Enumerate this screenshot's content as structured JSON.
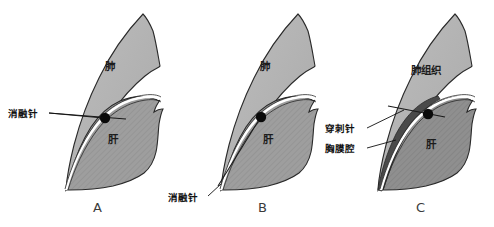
{
  "figure": {
    "type": "medical-illustration",
    "background_color": "#ffffff",
    "colors": {
      "lung_fill": "#b3b3b3",
      "liver_fill": "#9e9e9e",
      "pleural_cavity_fill": "#4a4a4a",
      "outline": "#2a2a2a",
      "diaphragm": "#ffffff",
      "tumor": "#0a0a0a",
      "text": "#111111",
      "panel_letter": "#3b3b3b"
    }
  },
  "panels": [
    {
      "letter": "A",
      "organ_labels": [
        {
          "text": "肺",
          "name": "lung"
        },
        {
          "text": "肝",
          "name": "liver"
        }
      ],
      "callouts": [
        {
          "text": "消融针",
          "name": "ablation-needle"
        }
      ],
      "tumor": {
        "name": "tumor-nodule",
        "shape": "filled-circle"
      }
    },
    {
      "letter": "B",
      "organ_labels": [
        {
          "text": "肺",
          "name": "lung"
        },
        {
          "text": "肝",
          "name": "liver"
        }
      ],
      "callouts": [
        {
          "text": "消融针",
          "name": "ablation-needle"
        }
      ],
      "tumor": {
        "name": "tumor-nodule",
        "shape": "filled-circle"
      }
    },
    {
      "letter": "C",
      "organ_labels": [
        {
          "text": "肺组织",
          "name": "lung-tissue"
        },
        {
          "text": "肝",
          "name": "liver"
        }
      ],
      "callouts": [
        {
          "text": "穿刺针",
          "name": "puncture-needle"
        },
        {
          "text": "胸膜腔",
          "name": "pleural-cavity"
        }
      ],
      "tumor": {
        "name": "tumor-nodule",
        "shape": "filled-circle"
      }
    }
  ]
}
